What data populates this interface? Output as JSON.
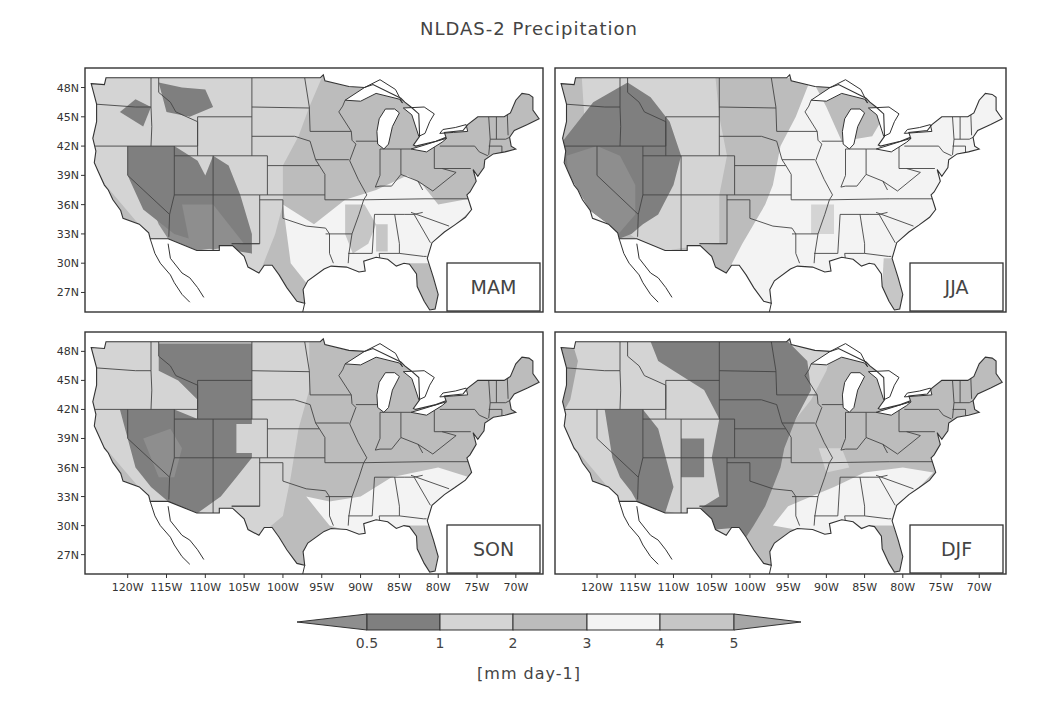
{
  "chart_data": {
    "type": "heatmap",
    "title": "NLDAS-2 Precipitation",
    "colorbar": {
      "label": "[mm day-1]",
      "ticks": [
        "0.5",
        "1",
        "2",
        "3",
        "4",
        "5"
      ],
      "levels": [
        0.5,
        1,
        2,
        3,
        4,
        5
      ],
      "colors": {
        "lt_0_5": "#8e8e8e",
        "0_5_to_1": "#7f7f7f",
        "1_to_2": "#d4d4d4",
        "2_to_3": "#bcbcbc",
        "3_to_4": "#f3f3f3",
        "4_to_5": "#c6c6c6",
        "gt_5": "#a6a6a6"
      },
      "extend": "both"
    },
    "x_ticks": [
      "120W",
      "115W",
      "110W",
      "105W",
      "100W",
      "95W",
      "90W",
      "85W",
      "80W",
      "75W",
      "70W"
    ],
    "y_ticks": [
      "48N",
      "45N",
      "42N",
      "39N",
      "36N",
      "33N",
      "30N",
      "27N"
    ],
    "xlim": [
      -125.5,
      -66.5
    ],
    "ylim": [
      25,
      50
    ],
    "panels": [
      {
        "season": "MAM",
        "position": "top-left",
        "description": "Dry (<1) over Southwest (AZ, NM, NV, UT) and western interior; 1-2 over northern Plains and West; 2-3 over Midwest/Northeast; 3-4 over Gulf Coast and Southeast/Ohio Valley; >4 in parts of lower Mississippi valley"
      },
      {
        "season": "JJA",
        "position": "top-right",
        "description": "Dry (<1) over California, Nevada, Oregon, Idaho, Utah; 1-2 over Rockies and High Plains; 2-3 Midwest; 3-4 over East and Southeast; 4-5 Florida"
      },
      {
        "season": "SON",
        "position": "bottom-left",
        "description": "Dry (<1) over Great Basin, Southwest, Montana, Wyoming, Colorado; 1-2 Plains; 2-3 Midwest/East; 3-4 Southeast/Gulf"
      },
      {
        "season": "DJF",
        "position": "bottom-right",
        "description": "Dry (<1) over Great Plains (MT, ND, SD, NE, KS, OK, west TX), Minnesota, Southwest; 1-2 Pacific coast and Upper Midwest; 2-3 Ohio Valley/Northeast; 3-4 Southeast/Gulf; >4 Pacific Northwest coast"
      }
    ]
  },
  "title": "NLDAS-2 Precipitation",
  "units": "[mm day-1]",
  "panels": [
    {
      "label": "MAM"
    },
    {
      "label": "JJA"
    },
    {
      "label": "SON"
    },
    {
      "label": "DJF"
    }
  ]
}
